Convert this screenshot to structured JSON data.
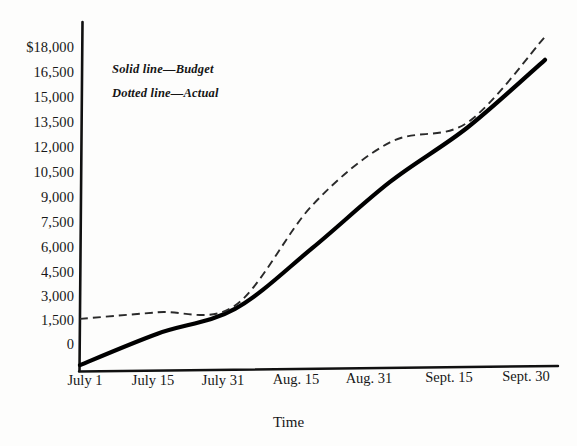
{
  "chart_data": {
    "type": "line",
    "title": "",
    "xlabel": "Time",
    "ylabel": "",
    "grid": false,
    "legend_position": "top-left-inside",
    "x": [
      "July 1",
      "July 15",
      "July 31",
      "Aug. 15",
      "Aug. 31",
      "Sept. 15",
      "Sept. 30"
    ],
    "xtick_labels": [
      "July 1",
      "July 15",
      "July 31",
      "Aug. 15",
      "Aug. 31",
      "Sept. 15",
      "Sept. 30"
    ],
    "ytick_labels": [
      "$18,000",
      "16,500",
      "15,000",
      "13,500",
      "12,000",
      "10,500",
      "9,000",
      "7,500",
      "6,000",
      "4,500",
      "3,000",
      "1,500",
      "0"
    ],
    "ytick_values": [
      18000,
      16500,
      15000,
      13500,
      12000,
      10500,
      9000,
      7500,
      6000,
      4500,
      3000,
      1500,
      0
    ],
    "ylim": [
      -1800,
      18600
    ],
    "series": [
      {
        "name": "Budget",
        "style": "solid",
        "color": "#000000",
        "values": [
          -1700,
          200,
          1700,
          5400,
          9400,
          12700,
          16800
        ]
      },
      {
        "name": "Actual",
        "style": "dotted",
        "color": "#000000",
        "values": [
          1100,
          1500,
          1900,
          8000,
          11800,
          13000,
          18200
        ]
      }
    ],
    "annotations": [
      "Solid line—Budget",
      "Dotted line—Actual"
    ]
  },
  "legend": {
    "solid": "Solid line—Budget",
    "dotted": "Dotted line—Actual"
  },
  "axes": {
    "x_title": "Time"
  }
}
